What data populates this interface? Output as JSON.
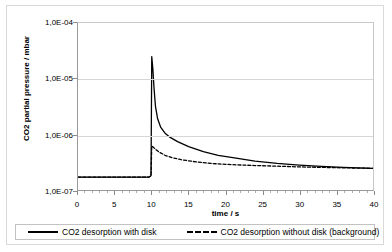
{
  "chart_data": {
    "type": "line",
    "title": "",
    "xlabel": "time / s",
    "ylabel": "CO2 partial pressure / mbar",
    "yscale": "log",
    "xlim": [
      0,
      40
    ],
    "ylim": [
      1e-07,
      0.0001
    ],
    "grid": "horizontal",
    "legend_position": "bottom",
    "ytick_labels": [
      "1,0E-04",
      "1,0E-05",
      "1,0E-06",
      "1,0E-07"
    ],
    "ytick_values": [
      0.0001,
      1e-05,
      1e-06,
      1e-07
    ],
    "xtick_labels": [
      "0",
      "5",
      "10",
      "15",
      "20",
      "25",
      "30",
      "35",
      "40"
    ],
    "xtick_values": [
      0,
      5,
      10,
      15,
      20,
      25,
      30,
      35,
      40
    ],
    "series": [
      {
        "name": "CO2 desorption with disk",
        "style": "solid",
        "color": "#000000",
        "x": [
          0,
          1,
          2,
          3,
          4,
          5,
          6,
          7,
          8,
          9,
          9.6,
          9.9,
          10.0,
          10.15,
          10.3,
          10.5,
          10.8,
          11.2,
          11.8,
          12.5,
          13.5,
          15,
          17,
          19,
          21,
          24,
          27,
          30,
          33,
          36,
          40
        ],
        "y": [
          1.7e-07,
          1.7e-07,
          1.7e-07,
          1.7e-07,
          1.7e-07,
          1.7e-07,
          1.7e-07,
          1.7e-07,
          1.7e-07,
          1.7e-07,
          1.7e-07,
          1.8e-07,
          2.5e-05,
          1.5e-05,
          7e-06,
          3.2e-06,
          1.9e-06,
          1.35e-06,
          1.05e-06,
          8.8e-07,
          7.4e-07,
          6e-07,
          4.9e-07,
          4.2e-07,
          3.8e-07,
          3.3e-07,
          3e-07,
          2.8e-07,
          2.65e-07,
          2.55e-07,
          2.45e-07
        ]
      },
      {
        "name": "CO2 desorption without disk (background)",
        "style": "dashed",
        "color": "#000000",
        "x": [
          0,
          1,
          2,
          3,
          4,
          5,
          6,
          7,
          8,
          9,
          9.6,
          9.9,
          10.0,
          10.2,
          10.5,
          11,
          11.8,
          12.8,
          14,
          16,
          18,
          21,
          24,
          27,
          30,
          33,
          36,
          40
        ],
        "y": [
          1.7e-07,
          1.7e-07,
          1.7e-07,
          1.7e-07,
          1.7e-07,
          1.7e-07,
          1.7e-07,
          1.7e-07,
          1.7e-07,
          1.7e-07,
          1.7e-07,
          1.8e-07,
          6.2e-07,
          5.9e-07,
          5.4e-07,
          4.8e-07,
          4.2e-07,
          3.8e-07,
          3.5e-07,
          3.2e-07,
          3e-07,
          2.85e-07,
          2.75e-07,
          2.68e-07,
          2.6e-07,
          2.55e-07,
          2.5e-07,
          2.45e-07
        ]
      }
    ]
  },
  "legend": {
    "entries": [
      {
        "label": "CO2 desorption with disk"
      },
      {
        "label": "CO2 desorption without disk (background)"
      }
    ]
  }
}
